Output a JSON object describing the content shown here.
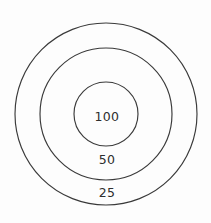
{
  "chart_data": {
    "type": "pie",
    "title": "",
    "subtitle": "",
    "xlabel": "",
    "ylabel": "",
    "legend_position": "none",
    "grid": false,
    "center": {
      "x": 106,
      "y": 114
    },
    "categories": [
      "100",
      "50",
      "25"
    ],
    "values": [
      100,
      50,
      25
    ],
    "rings": [
      {
        "label": "100",
        "value": 100,
        "radius": 32,
        "label_x": 107,
        "label_y": 117,
        "fill": "none",
        "stroke": "#3a3a3a"
      },
      {
        "label": "50",
        "value": 50,
        "radius": 66,
        "label_x": 107,
        "label_y": 160,
        "fill": "none",
        "stroke": "#3a3a3a"
      },
      {
        "label": "25",
        "value": 25,
        "radius": 91,
        "label_x": 107,
        "label_y": 193,
        "fill": "none",
        "stroke": "#3a3a3a"
      }
    ]
  },
  "canvas": {
    "width": 211,
    "height": 223,
    "background": "#fdfdfd"
  }
}
